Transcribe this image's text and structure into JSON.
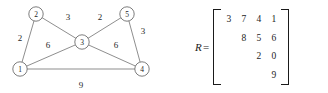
{
  "graph": {
    "nodes": [
      {
        "id": "n1",
        "label": "1",
        "cx": 20,
        "cy": 69
      },
      {
        "id": "n2",
        "label": "2",
        "cx": 36,
        "cy": 14
      },
      {
        "id": "n3",
        "label": "3",
        "cx": 82,
        "cy": 42
      },
      {
        "id": "n4",
        "label": "4",
        "cx": 142,
        "cy": 69
      },
      {
        "id": "n5",
        "label": "5",
        "cx": 127,
        "cy": 14
      }
    ],
    "edges": [
      {
        "from": "1",
        "to": "2",
        "weight": "2",
        "lx": 20,
        "ly": 41
      },
      {
        "from": "2",
        "to": "3",
        "weight": "3",
        "lx": 68,
        "ly": 20
      },
      {
        "from": "1",
        "to": "3",
        "weight": "6",
        "lx": 48,
        "ly": 48
      },
      {
        "from": "3",
        "to": "5",
        "weight": "2",
        "lx": 100,
        "ly": 20
      },
      {
        "from": "3",
        "to": "4",
        "weight": "6",
        "lx": 116,
        "ly": 48
      },
      {
        "from": "5",
        "to": "4",
        "weight": "3",
        "lx": 143,
        "ly": 34
      },
      {
        "from": "1",
        "to": "4",
        "weight": "9",
        "lx": 81,
        "ly": 88
      }
    ]
  },
  "matrix": {
    "name": "R",
    "equals": "=",
    "rows": [
      [
        "3",
        "7",
        "4",
        "1"
      ],
      [
        "",
        "8",
        "5",
        "6"
      ],
      [
        "",
        "",
        "2",
        "0"
      ],
      [
        "",
        "",
        "",
        "9"
      ]
    ]
  },
  "colors": {
    "stroke": "#7a7a7a",
    "node_stroke": "#6e6e6e",
    "text": "#1d1d1d",
    "bracket": "#1a1a1a",
    "background": "#ffffff"
  }
}
